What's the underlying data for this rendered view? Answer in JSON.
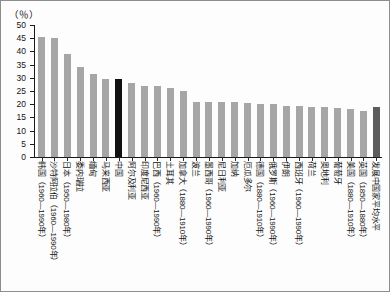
{
  "chart_data": {
    "type": "bar",
    "title": "",
    "subtitle": "",
    "unit_label": "（％）",
    "xlabel": "",
    "ylabel": "",
    "ylim": [
      0,
      50
    ],
    "ytick_labels": [
      "50",
      "45",
      "40",
      "35",
      "30",
      "25",
      "20",
      "15",
      "10",
      "5",
      "0"
    ],
    "ytick_values": [
      50,
      45,
      40,
      35,
      30,
      25,
      20,
      15,
      10,
      5,
      0
    ],
    "grid": false,
    "legend": "none",
    "highlight_category": "中国",
    "highlight_color": "#121212",
    "bar_color": "#a6a6a6",
    "average_color": "#5d5d5d",
    "categories": [
      "韩国（1960—1990年）",
      "沙特阿拉伯（1960—1990年）",
      "日本（1950—1980年）",
      "委内瑞拉",
      "缅甸",
      "马来西亚",
      "中国",
      "阿尔及利亚",
      "印度尼西亚",
      "巴西（1960—1990年）",
      "土耳其",
      "加拿大（1880—1910年）",
      "波兰",
      "墨西哥（1960—1990年）",
      "尼日利亚",
      "加纳",
      "厄瓜多尔",
      "德国（1880—1910年）",
      "俄罗斯（1960—1990年）",
      "伊朗",
      "西班牙（1960—1990年）",
      "荷兰",
      "奥地利",
      "葡萄牙",
      "美国（1880—1910年）",
      "英国（1850—1880年）",
      "发展中国家平均水平"
    ],
    "values": [
      45.5,
      45.0,
      39.0,
      34.0,
      31.5,
      29.5,
      29.5,
      28.0,
      27.0,
      27.0,
      26.0,
      25.0,
      21.0,
      21.0,
      21.0,
      21.0,
      20.5,
      20.0,
      20.0,
      19.5,
      19.5,
      19.0,
      19.0,
      18.5,
      18.0,
      17.5,
      19.0
    ]
  }
}
